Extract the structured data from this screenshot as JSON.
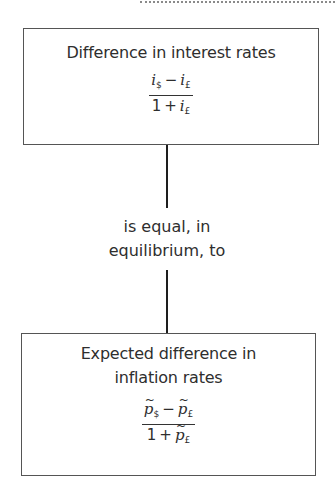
{
  "diagram": {
    "top_box": {
      "title": "Difference in interest rates",
      "formula": {
        "numerator": {
          "left_var": "i",
          "left_sub": "$",
          "operator": "−",
          "right_var": "i",
          "right_sub": "£"
        },
        "denominator": {
          "constant": "1",
          "operator": "+",
          "var": "i",
          "sub": "£"
        }
      }
    },
    "connector": {
      "label_line1": "is equal, in",
      "label_line2": "equilibrium, to"
    },
    "bottom_box": {
      "title_line1": "Expected difference in",
      "title_line2": "inflation rates",
      "formula": {
        "tilde": "~",
        "numerator": {
          "left_var": "p",
          "left_sub": "$",
          "operator": "−",
          "right_var": "p",
          "right_sub": "£"
        },
        "denominator": {
          "constant": "1",
          "operator": "+",
          "var": "p",
          "sub": "£"
        }
      }
    }
  }
}
